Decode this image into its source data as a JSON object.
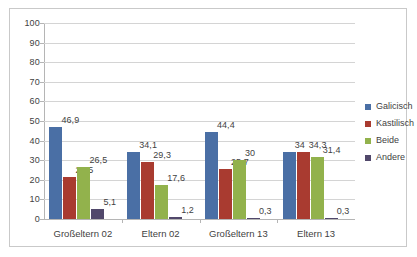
{
  "chart_data": {
    "type": "bar",
    "title": "",
    "xlabel": "",
    "ylabel": "",
    "ylim": [
      0,
      100
    ],
    "grid": true,
    "legend_position": "right",
    "categories": [
      "Großeltern 02",
      "Eltern 02",
      "Großeltern 13",
      "Eltern 13"
    ],
    "y_ticks": [
      "0",
      "10",
      "20",
      "30",
      "40",
      "50",
      "60",
      "70",
      "80",
      "90",
      "100"
    ],
    "series": [
      {
        "name": "Galicisch",
        "color": "#4A6FA5",
        "values": [
          46.9,
          34.1,
          44.4,
          34
        ],
        "labels": [
          "46,9",
          "34,1",
          "44,4",
          "34"
        ]
      },
      {
        "name": "Kastilisch",
        "color": "#A93B30",
        "values": [
          21.5,
          29.3,
          25.7,
          34.3
        ],
        "labels": [
          "21,5",
          "29,3",
          "25,7",
          "34,3"
        ]
      },
      {
        "name": "Beide",
        "color": "#92B24C",
        "values": [
          26.5,
          17.6,
          30,
          31.4
        ],
        "labels": [
          "26,5",
          "17,6",
          "30",
          "31,4"
        ]
      },
      {
        "name": "Andere",
        "color": "#51486B",
        "values": [
          5.1,
          1.2,
          0.3,
          0.3
        ],
        "labels": [
          "5,1",
          "1,2",
          "0,3",
          "0,3"
        ]
      }
    ]
  },
  "colors": {
    "grid": "#d4d4d4",
    "axis": "#b5b5b5",
    "frame": "#c9c9c9",
    "text": "#3f3f3f",
    "background": "#ffffff"
  }
}
